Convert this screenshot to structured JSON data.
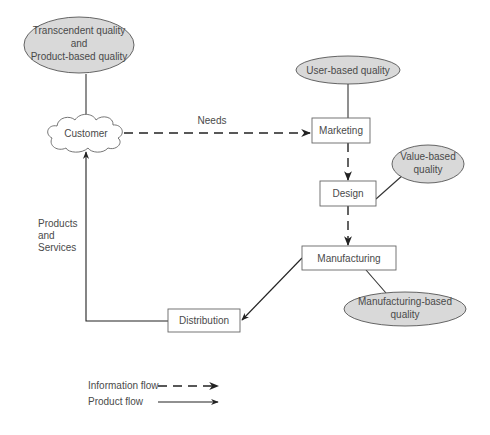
{
  "diagram": {
    "quality_views": {
      "transcendent_product": {
        "line1": "Transcendent quality",
        "line2": "and",
        "line3": "Product-based quality"
      },
      "user_based": {
        "label": "User-based quality"
      },
      "value_based": {
        "line1": "Value-based",
        "line2": "quality"
      },
      "manufacturing_based": {
        "line1": "Manufacturing-based",
        "line2": "quality"
      }
    },
    "nodes": {
      "customer": "Customer",
      "marketing": "Marketing",
      "design": "Design",
      "manufacturing": "Manufacturing",
      "distribution": "Distribution"
    },
    "edge_labels": {
      "needs": "Needs",
      "products_line1": "Products",
      "products_line2": "and",
      "products_line3": "Services"
    },
    "legend": {
      "information_flow": "Information flow",
      "product_flow": "Product flow"
    },
    "colors": {
      "ellipse_fill": "#d9d9d9",
      "box_fill": "#ffffff",
      "line": "#222222",
      "text": "#4a4a4a"
    }
  }
}
